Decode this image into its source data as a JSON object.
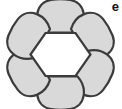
{
  "figure": {
    "panel_label": "e",
    "background_color": "#ffffff",
    "petal_fill_color": "#d9d9d9",
    "petal_stroke_color": "#3b3b3b",
    "core_fill_color": "#ffffff",
    "core_stroke_color": "#3b3b3b",
    "petal_count": 6,
    "core_shape": "hexagon",
    "stroke_width": 2.2,
    "petals": [
      {
        "name": "petal-top",
        "angle_deg": 270,
        "index": 0
      },
      {
        "name": "petal-upper-right",
        "angle_deg": 330,
        "index": 1
      },
      {
        "name": "petal-lower-right",
        "angle_deg": 30,
        "index": 2
      },
      {
        "name": "petal-bottom",
        "angle_deg": 90,
        "index": 3
      },
      {
        "name": "petal-lower-left",
        "angle_deg": 150,
        "index": 4
      },
      {
        "name": "petal-upper-left",
        "angle_deg": 210,
        "index": 5
      }
    ],
    "core_vertices": [
      {
        "x": 30.5,
        "y": 54.5
      },
      {
        "x": 44.0,
        "y": 33.0
      },
      {
        "x": 77.5,
        "y": 33.0
      },
      {
        "x": 91.0,
        "y": 54.5
      },
      {
        "x": 77.5,
        "y": 76.0
      },
      {
        "x": 44.0,
        "y": 76.0
      }
    ],
    "center": {
      "x": 60.5,
      "y": 54.5
    }
  }
}
